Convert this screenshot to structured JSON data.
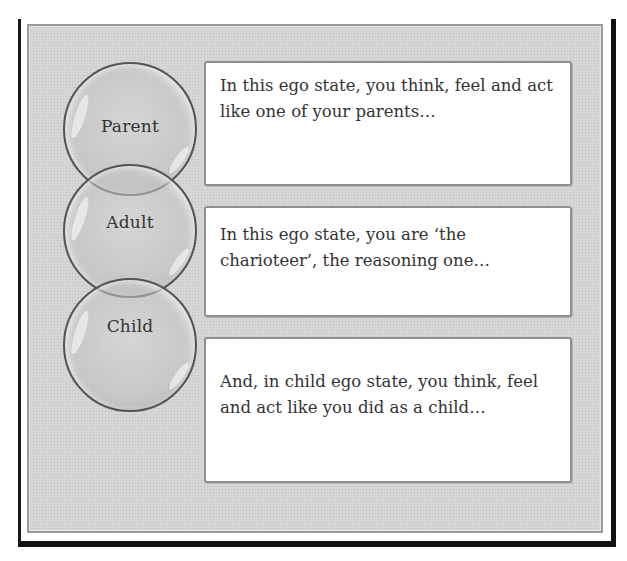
{
  "diagram": {
    "colors": {
      "frame": "#111111",
      "panel_background": "#d4d4d4",
      "panel_border": "#9a9a9a",
      "circle_fill": "#c4c4c4",
      "circle_outline": "#555555",
      "textbox_background": "#ffffff",
      "textbox_border": "#8f8f8f",
      "text": "#333333"
    },
    "ego_states": [
      {
        "name": "Parent",
        "description": "In this ego state, you think, feel and act like one of your parents…"
      },
      {
        "name": "Adult",
        "description": "In this ego state, you are ‘the charioteer’, the reasoning one…"
      },
      {
        "name": "Child",
        "description": "And, in child ego state, you think, feel and act like you did as a child…"
      }
    ]
  }
}
